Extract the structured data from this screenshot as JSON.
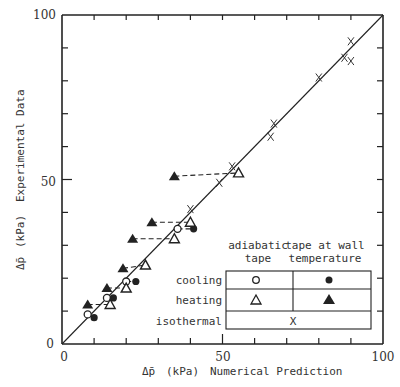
{
  "chart_data": {
    "type": "scatter",
    "title": "",
    "xlabel": "Δp̄ (kPa)  Numerical Prediction",
    "ylabel": "Δp̄ (kPa)  Experimental Data",
    "xlim": [
      0,
      100
    ],
    "ylim": [
      0,
      100
    ],
    "x_ticks": [
      0,
      50,
      100
    ],
    "y_ticks": [
      0,
      50,
      100
    ],
    "grid": false,
    "reference_line": {
      "label": "y = x",
      "from": [
        0,
        0
      ],
      "to": [
        100,
        100
      ]
    },
    "legend": {
      "position": "lower right",
      "column_headers": [
        "adiabatic tape",
        "tape at wall temperature"
      ],
      "rows": [
        {
          "label": "cooling",
          "adiabatic": "open circle",
          "wall": "filled circle"
        },
        {
          "label": "heating",
          "adiabatic": "open triangle",
          "wall": "filled triangle"
        },
        {
          "label": "isothermal",
          "both": "x"
        }
      ]
    },
    "series": [
      {
        "name": "cooling, adiabatic tape",
        "marker": "open-circle",
        "points": [
          [
            8,
            9
          ],
          [
            14,
            14
          ],
          [
            20,
            19
          ],
          [
            36,
            35
          ]
        ]
      },
      {
        "name": "cooling, tape at wall temperature",
        "marker": "filled-circle",
        "points": [
          [
            10,
            8
          ],
          [
            16,
            14
          ],
          [
            23,
            19
          ],
          [
            41,
            35
          ]
        ]
      },
      {
        "name": "heating, adiabatic tape",
        "marker": "open-triangle",
        "points": [
          [
            15,
            12
          ],
          [
            20,
            17
          ],
          [
            26,
            24
          ],
          [
            35,
            32
          ],
          [
            40,
            37
          ],
          [
            55,
            52
          ]
        ]
      },
      {
        "name": "heating, tape at wall temperature",
        "marker": "filled-triangle",
        "points": [
          [
            8,
            12
          ],
          [
            14,
            17
          ],
          [
            19,
            23
          ],
          [
            22,
            32
          ],
          [
            28,
            37
          ],
          [
            35,
            51
          ]
        ]
      },
      {
        "name": "isothermal",
        "marker": "x",
        "points": [
          [
            40,
            41
          ],
          [
            49,
            49
          ],
          [
            53,
            54
          ],
          [
            65,
            63
          ],
          [
            66,
            67
          ],
          [
            80,
            81
          ],
          [
            88,
            87
          ],
          [
            90,
            86
          ],
          [
            90,
            92
          ]
        ]
      }
    ],
    "dashed_connectors": [
      [
        [
          8,
          12
        ],
        [
          15,
          12
        ]
      ],
      [
        [
          14,
          17
        ],
        [
          20,
          17
        ]
      ],
      [
        [
          19,
          23
        ],
        [
          26,
          24
        ]
      ],
      [
        [
          22,
          32
        ],
        [
          35,
          32
        ]
      ],
      [
        [
          28,
          37
        ],
        [
          40,
          37
        ]
      ],
      [
        [
          35,
          51
        ],
        [
          55,
          52
        ]
      ],
      [
        [
          8,
          9
        ],
        [
          10,
          8
        ]
      ],
      [
        [
          14,
          14
        ],
        [
          16,
          14
        ]
      ],
      [
        [
          20,
          19
        ],
        [
          23,
          19
        ]
      ],
      [
        [
          36,
          35
        ],
        [
          41,
          35
        ]
      ]
    ]
  },
  "axes": {
    "x_tick_labels": [
      "0",
      "50",
      "100"
    ],
    "y_tick_labels": [
      "0",
      "50",
      "100"
    ],
    "x_title_symbol": "Δp̄",
    "x_title_unit": "(kPa)",
    "x_title_text": "Numerical Prediction",
    "y_title_symbol": "Δp̄",
    "y_title_unit": "(kPa)",
    "y_title_text": "Experimental Data"
  },
  "legend": {
    "header_col1_line1": "adiabatic",
    "header_col1_line2": "tape",
    "header_col2_line1": "tape at wall",
    "header_col2_line2": "temperature",
    "row_cooling": "cooling",
    "row_heating": "heating",
    "row_isothermal": "isothermal",
    "iso_symbol": "X"
  }
}
